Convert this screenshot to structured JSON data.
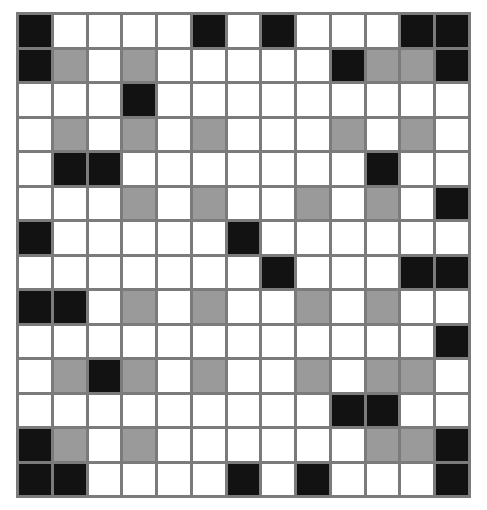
{
  "figure": {
    "name": "grid-pattern",
    "kind": "cell-grid",
    "background_color": "#ffffff"
  },
  "grid": {
    "columns": 13,
    "rows": 14,
    "gridline_color": "#7b7b7b",
    "gridline_width_px": 3,
    "border_color": "#7b7b7b",
    "border_width_px": 3,
    "cell_width_px": 32,
    "cell_height_px": 32,
    "offset_left_px": 16,
    "offset_top_px": 12,
    "palette": {
      "white": "#ffffff",
      "gray": "#9a9a9a",
      "black": "#121212"
    },
    "legend": {
      "white_label": "empty",
      "gray_label": "half-filled",
      "black_label": "filled"
    },
    "counts": {
      "white": 125,
      "gray": 29,
      "black": 28,
      "total": 182
    },
    "cells": [
      [
        "black",
        "white",
        "white",
        "white",
        "white",
        "black",
        "white",
        "black",
        "white",
        "white",
        "white",
        "black",
        "black"
      ],
      [
        "black",
        "gray",
        "white",
        "gray",
        "white",
        "white",
        "white",
        "white",
        "white",
        "black",
        "gray",
        "gray",
        "black"
      ],
      [
        "white",
        "white",
        "white",
        "black",
        "white",
        "white",
        "white",
        "white",
        "white",
        "white",
        "white",
        "white",
        "white"
      ],
      [
        "white",
        "gray",
        "white",
        "gray",
        "white",
        "gray",
        "white",
        "white",
        "white",
        "gray",
        "white",
        "gray",
        "white"
      ],
      [
        "white",
        "black",
        "black",
        "white",
        "white",
        "white",
        "white",
        "white",
        "white",
        "white",
        "black",
        "white",
        "white"
      ],
      [
        "white",
        "white",
        "white",
        "gray",
        "white",
        "gray",
        "white",
        "white",
        "gray",
        "white",
        "gray",
        "white",
        "black"
      ],
      [
        "black",
        "white",
        "white",
        "white",
        "white",
        "white",
        "black",
        "white",
        "white",
        "white",
        "white",
        "white",
        "white"
      ],
      [
        "white",
        "white",
        "white",
        "white",
        "white",
        "white",
        "white",
        "black",
        "white",
        "white",
        "white",
        "black",
        "black"
      ],
      [
        "black",
        "black",
        "white",
        "gray",
        "white",
        "gray",
        "white",
        "white",
        "gray",
        "white",
        "gray",
        "white",
        "white"
      ],
      [
        "white",
        "white",
        "white",
        "white",
        "white",
        "white",
        "white",
        "white",
        "white",
        "white",
        "white",
        "white",
        "black"
      ],
      [
        "white",
        "gray",
        "black",
        "gray",
        "white",
        "gray",
        "white",
        "white",
        "gray",
        "white",
        "gray",
        "gray",
        "white"
      ],
      [
        "white",
        "white",
        "white",
        "white",
        "white",
        "white",
        "white",
        "white",
        "white",
        "black",
        "black",
        "white",
        "white"
      ],
      [
        "black",
        "gray",
        "white",
        "gray",
        "white",
        "white",
        "white",
        "white",
        "white",
        "white",
        "gray",
        "gray",
        "black"
      ],
      [
        "black",
        "black",
        "white",
        "white",
        "white",
        "white",
        "black",
        "white",
        "black",
        "white",
        "white",
        "white",
        "black"
      ]
    ]
  }
}
